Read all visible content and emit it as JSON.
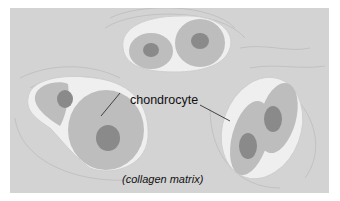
{
  "diagram": {
    "labels": {
      "cell": "chondrocyte",
      "matrix": "(collagen matrix)"
    },
    "cell_groups": [
      {
        "name": "top-pair",
        "cells": 2
      },
      {
        "name": "left-pair",
        "cells": 2
      },
      {
        "name": "right-pair",
        "cells": 2
      }
    ],
    "colors": {
      "background": "#d3d3d3",
      "lacuna_rim": "#efefef",
      "cytoplasm": "#b9b9b9",
      "nucleus": "#8a8a8a",
      "matrix_lines": "#bdbdbd",
      "leader_line": "#333333"
    }
  }
}
